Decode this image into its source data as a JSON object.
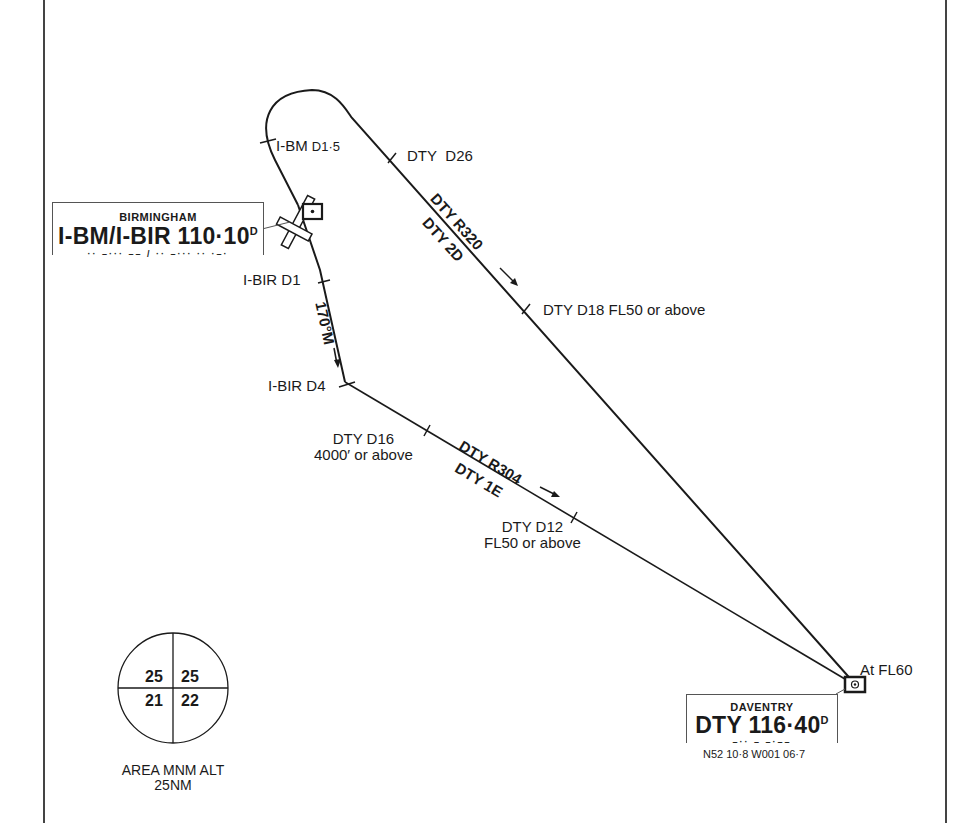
{
  "chart": {
    "procedure_type": "holding / approach course diagram",
    "navaids": {
      "birmingham": {
        "name": "BIRMINGHAM",
        "ident_freq": "I-BM/I-BIR 110·10",
        "dme_flag": "D",
        "morse": "·· –··· –– / ·· –··· ·· ·–·"
      },
      "daventry": {
        "name": "DAVENTRY",
        "ident": "DTY",
        "freq": "116·40",
        "dme_flag": "D",
        "morse": "–·· – –·––",
        "coords": "N52 10·8 W001 06·7",
        "altitude_note": "At FL60"
      }
    },
    "fixes": [
      {
        "id": "ibm-d15",
        "label_main": "I-BM",
        "label_d": "D1·5"
      },
      {
        "id": "dty-d26",
        "label_main": "DTY",
        "label_d": "D26"
      },
      {
        "id": "ibir-d1",
        "label_main": "I-BIR",
        "label_d": "D1"
      },
      {
        "id": "ibir-d4",
        "label_main": "I-BIR",
        "label_d": "D4"
      },
      {
        "id": "dty-d18",
        "label_main": "DTY",
        "label_d": "D18",
        "label_alt": "FL50 or above"
      },
      {
        "id": "dty-d16",
        "label_main": "DTY",
        "label_d": "D16",
        "label_alt": "4000′ or above"
      },
      {
        "id": "dty-d12",
        "label_main": "DTY",
        "label_d": "D12",
        "label_alt": "FL50 or above"
      }
    ],
    "tracks": [
      {
        "id": "outbound-r320",
        "radial": "DTY R320",
        "route": "DTY 2D"
      },
      {
        "id": "inbound-170",
        "course": "170°M"
      },
      {
        "id": "r304",
        "radial": "DTY R304",
        "route": "DTY 1E"
      }
    ],
    "msa": {
      "values": {
        "nw": "25",
        "ne": "25",
        "sw": "21",
        "se": "22"
      },
      "caption_line1": "AREA MNM ALT",
      "caption_line2": "25NM"
    }
  }
}
